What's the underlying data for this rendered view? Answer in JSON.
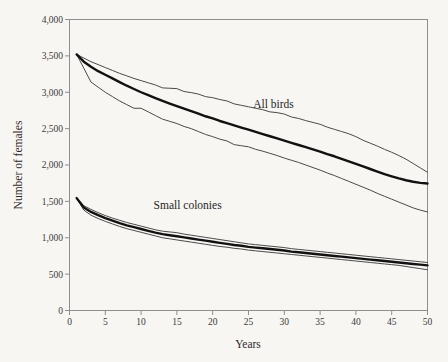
{
  "chart_data": {
    "type": "line",
    "title": "",
    "xlabel": "Years",
    "ylabel": "Number of females",
    "xlim": [
      0,
      50
    ],
    "ylim": [
      0,
      4000
    ],
    "grid": false,
    "legend_position": "inline-annotations",
    "xticks": [
      "0",
      "5",
      "10",
      "15",
      "20",
      "25",
      "30",
      "35",
      "40",
      "45",
      "50"
    ],
    "xtick_values": [
      0,
      5,
      10,
      15,
      20,
      25,
      30,
      35,
      40,
      45,
      50
    ],
    "yticks": [
      "0",
      "500",
      "1,000",
      "1,500",
      "2,000",
      "2,500",
      "3,000",
      "3,500",
      "4,000"
    ],
    "ytick_values": [
      0,
      500,
      1000,
      1500,
      2000,
      2500,
      3000,
      3500,
      4000
    ],
    "annotations": [
      {
        "text": "All birds",
        "x": 28.5,
        "y": 2790
      },
      {
        "text": "Small colonies",
        "x": 16.5,
        "y": 1400
      }
    ],
    "x": [
      1,
      2,
      3,
      4,
      5,
      6,
      7,
      8,
      9,
      10,
      11,
      12,
      13,
      14,
      15,
      16,
      17,
      18,
      19,
      20,
      21,
      22,
      23,
      24,
      25,
      26,
      27,
      28,
      29,
      30,
      31,
      32,
      33,
      34,
      35,
      36,
      37,
      38,
      39,
      40,
      41,
      42,
      43,
      44,
      45,
      46,
      47,
      48,
      49,
      50
    ],
    "series": [
      {
        "name": "All birds upper CI",
        "style": "thin",
        "values": [
          3520,
          3470,
          3420,
          3380,
          3340,
          3300,
          3260,
          3225,
          3190,
          3160,
          3130,
          3100,
          3060,
          3055,
          3050,
          3010,
          2995,
          2975,
          2940,
          2925,
          2900,
          2880,
          2840,
          2820,
          2800,
          2780,
          2760,
          2730,
          2720,
          2700,
          2660,
          2640,
          2610,
          2585,
          2560,
          2520,
          2490,
          2460,
          2430,
          2390,
          2340,
          2300,
          2260,
          2215,
          2175,
          2130,
          2080,
          2020,
          1960,
          1900
        ]
      },
      {
        "name": "All birds mean",
        "style": "bold",
        "values": [
          3520,
          3420,
          3350,
          3290,
          3240,
          3190,
          3140,
          3090,
          3045,
          3000,
          2960,
          2920,
          2880,
          2845,
          2810,
          2775,
          2740,
          2705,
          2670,
          2640,
          2605,
          2575,
          2545,
          2515,
          2485,
          2455,
          2425,
          2395,
          2365,
          2335,
          2305,
          2275,
          2245,
          2215,
          2185,
          2150,
          2120,
          2085,
          2050,
          2015,
          1980,
          1945,
          1910,
          1875,
          1845,
          1815,
          1790,
          1770,
          1755,
          1745
        ]
      },
      {
        "name": "All birds lower CI",
        "style": "thin",
        "values": [
          3520,
          3330,
          3140,
          3070,
          3000,
          2940,
          2880,
          2830,
          2780,
          2780,
          2730,
          2680,
          2630,
          2600,
          2570,
          2530,
          2500,
          2460,
          2420,
          2390,
          2355,
          2330,
          2280,
          2265,
          2250,
          2215,
          2190,
          2160,
          2130,
          2095,
          2065,
          2035,
          2000,
          1965,
          1930,
          1890,
          1855,
          1815,
          1775,
          1735,
          1695,
          1655,
          1610,
          1570,
          1530,
          1490,
          1450,
          1410,
          1380,
          1355
        ]
      },
      {
        "name": "Small colonies upper CI",
        "style": "thin",
        "values": [
          1545,
          1440,
          1390,
          1345,
          1305,
          1270,
          1240,
          1210,
          1185,
          1160,
          1135,
          1110,
          1090,
          1080,
          1070,
          1050,
          1035,
          1020,
          1005,
          990,
          975,
          960,
          945,
          930,
          915,
          905,
          895,
          885,
          875,
          865,
          850,
          840,
          830,
          820,
          810,
          800,
          790,
          780,
          770,
          760,
          750,
          740,
          730,
          720,
          710,
          700,
          690,
          680,
          670,
          660
        ]
      },
      {
        "name": "Small colonies mean",
        "style": "bold",
        "values": [
          1545,
          1415,
          1355,
          1310,
          1270,
          1235,
          1200,
          1170,
          1145,
          1120,
          1095,
          1070,
          1050,
          1035,
          1020,
          1005,
          990,
          975,
          960,
          945,
          930,
          915,
          900,
          890,
          875,
          865,
          855,
          845,
          835,
          825,
          810,
          800,
          790,
          780,
          770,
          760,
          750,
          740,
          730,
          720,
          710,
          700,
          690,
          680,
          670,
          660,
          650,
          640,
          630,
          620
        ]
      },
      {
        "name": "Small colonies lower CI",
        "style": "thin",
        "values": [
          1545,
          1380,
          1310,
          1265,
          1225,
          1190,
          1155,
          1125,
          1100,
          1075,
          1050,
          1025,
          1000,
          985,
          970,
          955,
          940,
          925,
          910,
          895,
          880,
          870,
          855,
          845,
          830,
          820,
          810,
          800,
          790,
          780,
          770,
          760,
          750,
          740,
          730,
          720,
          710,
          700,
          690,
          680,
          670,
          660,
          650,
          640,
          630,
          620,
          605,
          590,
          575,
          560
        ]
      }
    ]
  },
  "colors": {
    "background": "#f7f6f3",
    "frame": "#8e8e8e",
    "mean_line": "#111111",
    "ci_line": "#4a4a4a",
    "text": "#2b2b2b"
  }
}
